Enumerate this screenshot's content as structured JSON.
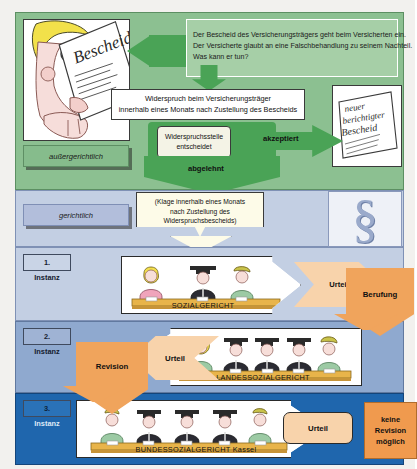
{
  "diagram": {
    "sections": {
      "extrajudicial": {
        "label": "außergerichtlich",
        "color": "#8cc091"
      },
      "judicial": {
        "label": "gerichtlich",
        "color": "#c3cfe3"
      }
    },
    "intro": {
      "line1": "Der Bescheid des Versicherungsträgers geht beim Versicherten ein.",
      "line2": "Der Versicherte glaubt an eine Falschbehandlung zu seinem Nachteil.",
      "line3": "Was kann er tun?"
    },
    "illustration_bescheid": {
      "doc_label": "Bescheid",
      "alt": "Cartoon eines Versicherten, der einen Bescheid liest"
    },
    "objection_box": {
      "line1": "Widerspruch beim Versicherungsträger",
      "line2": "innerhalb eines Monats nach Zustellung des Bescheids"
    },
    "decision_box": {
      "line1": "Widerspruchsstelle",
      "line2": "entscheidet"
    },
    "accepted_label": "akzeptiert",
    "rejected_label": "abgelehnt",
    "new_notice_doc": {
      "line1": "neuer",
      "line2": "berichtigter",
      "line3": "Bescheid"
    },
    "claim_box": {
      "line1": "(Klage innerhalb eines Monats",
      "line2": "nach Zustellung des",
      "line3": "Widerspruchsbescheids)"
    },
    "paragraph_symbol": "§",
    "instances": [
      {
        "number": "1.",
        "word": "Instanz",
        "court": "SOZIALGERICHT",
        "judgment_label": "Urteil",
        "appeal_label": "Berufung",
        "tag_color": "#c9d4e6",
        "row_color": "#c3cfe3"
      },
      {
        "number": "2.",
        "word": "Instanz",
        "court": "LANDESSOZIALGERICHT",
        "judgment_label": "Urteil",
        "appeal_label": "Revision",
        "tag_color": "#9fb3d4",
        "row_color": "#8fa9cf"
      },
      {
        "number": "3.",
        "word": "Instanz",
        "court": "BUNDESSOZIALGERICHT Kassel",
        "judgment_label": "Urteil",
        "appeal_label": "keine Revision möglich",
        "tag_color": "#2a72b8",
        "row_color": "#1f66ad"
      }
    ],
    "colors": {
      "green_arrow": "#4aa356",
      "green_panel": "#8cc091",
      "blue_light": "#c3cfe3",
      "blue_mid": "#8fa9cf",
      "blue_dark": "#1f66ad",
      "orange_light": "#f8d3ab",
      "orange_strong": "#f0a45c",
      "cream": "#fdfbe8"
    }
  }
}
